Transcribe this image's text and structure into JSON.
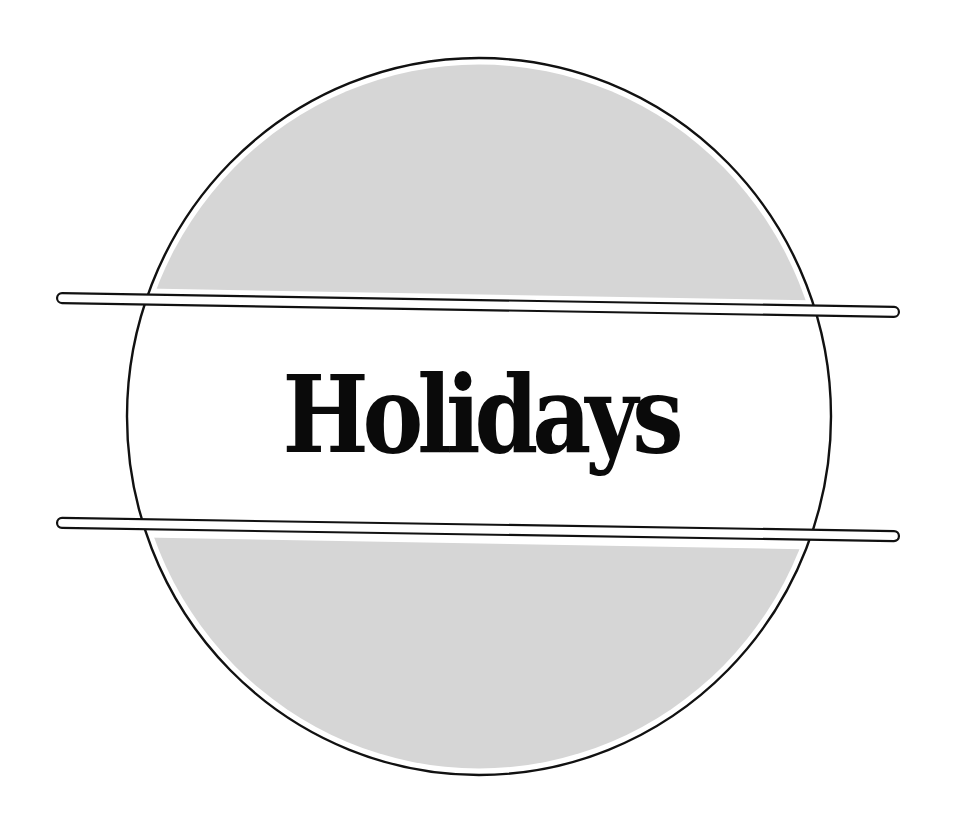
{
  "title": {
    "text": "Holidays"
  },
  "emblem": {
    "shape": "circle",
    "center": [
      479,
      416
    ],
    "radius_x": 352,
    "radius_y": 358,
    "outline_color": "#111111",
    "fill_color": "#d6d6d6",
    "band_color": "#ffffff"
  },
  "bars": [
    {
      "name": "upper-bar",
      "left": [
        57,
        298
      ],
      "right": [
        899,
        312
      ]
    },
    {
      "name": "lower-bar",
      "left": [
        57,
        523
      ],
      "right": [
        899,
        536
      ]
    }
  ],
  "colors": {
    "background": "#ffffff",
    "ink": "#0a0a0a",
    "gray_fill": "#d6d6d6"
  }
}
